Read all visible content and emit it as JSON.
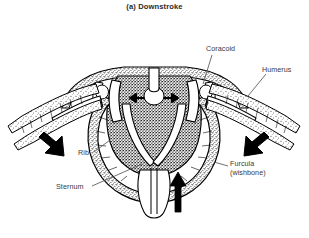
{
  "figure": {
    "title": "(a) Downstroke",
    "background_color": "#ffffff",
    "ink_color": "#000000",
    "label_color": "#3a3a3a"
  },
  "labels": {
    "coracoid": "Coracoid",
    "humerus": "Humerus",
    "rib": "Rib",
    "sternum": "Sternum",
    "furcula_line1": "Furcula",
    "furcula_line2": "(wishbone)"
  },
  "arrows": {
    "left_wing": "down-left-thick-arrow",
    "right_wing": "down-right-thick-arrow",
    "sternum_up": "up-thick-arrow",
    "muscle_left": "small-left-arrow",
    "muscle_right": "small-right-arrow"
  }
}
